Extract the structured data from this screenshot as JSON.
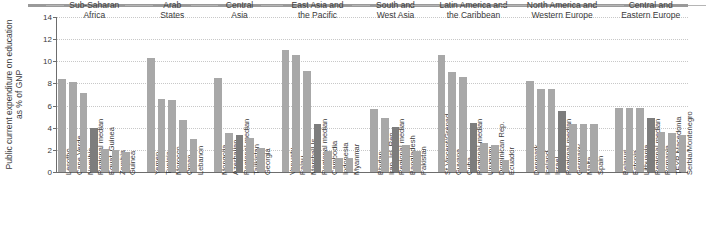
{
  "figure": {
    "ylabel": "Public current expenditure on education as % of GNP",
    "footnote": ""
  },
  "chart_data": {
    "type": "bar",
    "title": "",
    "xlabel": "",
    "ylabel": "Public current expenditure on education as % of GNP",
    "ylim": [
      0,
      14
    ],
    "yticks": [
      0,
      2,
      4,
      6,
      8,
      10,
      12,
      14
    ],
    "ytick_labels": [
      "0",
      "2",
      "4",
      "6",
      "8",
      "10",
      "12",
      "14"
    ],
    "grid": true,
    "legend": null,
    "median_color": "#7d7d7d",
    "bar_color": "#a8a8a8",
    "groups": [
      {
        "name": "Sub-Saharan Africa",
        "name_lines": [
          "Sub-Saharan",
          "Africa"
        ],
        "categories": [
          "Lesotho",
          "Cape Verde",
          "Namibia",
          "Regional median",
          "Equat. Guinea",
          "Zambia",
          "Guinea"
        ],
        "values": [
          8.4,
          8.1,
          7.1,
          4.0,
          2.1,
          2.0,
          1.8
        ],
        "median_index": 3
      },
      {
        "name": "Arab States",
        "name_lines": [
          "Arab",
          "States"
        ],
        "categories": [
          "Yemen",
          "Tunisia",
          "Morocco",
          "Oman",
          "Lebanon"
        ],
        "values": [
          10.3,
          6.6,
          6.5,
          4.7,
          3.0
        ],
        "median_index": -1
      },
      {
        "name": "Central Asia",
        "name_lines": [
          "Central",
          "Asia"
        ],
        "categories": [
          "Mongolia",
          "Azerbaijan",
          "Regional median",
          "Tajikistan",
          "Georgia"
        ],
        "values": [
          8.5,
          3.5,
          3.3,
          3.1,
          2.2
        ],
        "median_index": 2
      },
      {
        "name": "East Asia and the Pacific",
        "name_lines": [
          "East Asia and",
          "the Pacific"
        ],
        "categories": [
          "Vanuatu",
          "Palau",
          "Marshall Is",
          "Regional median",
          "Cambodia",
          "Indonesia",
          "Myanmar"
        ],
        "values": [
          11.0,
          10.6,
          9.1,
          4.3,
          1.9,
          1.3,
          1.3
        ],
        "median_index": 3
      },
      {
        "name": "South and West Asia",
        "name_lines": [
          "South and",
          "West Asia"
        ],
        "categories": [
          "Bhutan",
          "Iran, Isl. Rep.",
          "Regional median",
          "Bangladesh",
          "Pakistan"
        ],
        "values": [
          5.7,
          4.9,
          4.1,
          2.4,
          1.9
        ],
        "median_index": 2
      },
      {
        "name": "Latin America and the Caribbean",
        "name_lines": [
          "Latin America and",
          "the Caribbean"
        ],
        "categories": [
          "St Vincent/Grenad.",
          "Guyana",
          "Cuba",
          "Regional median",
          "Uruguay",
          "Dominican Rep.",
          "Ecuador"
        ],
        "values": [
          10.6,
          9.0,
          8.6,
          4.4,
          2.6,
          2.4,
          1.1
        ],
        "median_index": 3
      },
      {
        "name": "North America and Western Europe",
        "name_lines": [
          "North America and",
          "Western Europe"
        ],
        "categories": [
          "Denmark",
          "Iceland",
          "Israel",
          "Regional median",
          "Germany",
          "Malta",
          "Spain"
        ],
        "values": [
          8.2,
          7.5,
          7.5,
          5.5,
          4.3,
          4.3,
          4.3
        ],
        "median_index": 3
      },
      {
        "name": "Central and Eastern Europe",
        "name_lines": [
          "Central and",
          "Eastern Europe"
        ],
        "categories": [
          "Belarus",
          "Estonia",
          "Lithuania",
          "Regional median",
          "Romania",
          "TFYR Macedonia",
          "Serbia/Montenegro"
        ],
        "values": [
          5.8,
          5.8,
          5.8,
          4.9,
          3.6,
          3.5,
          3.3
        ],
        "median_index": 3
      }
    ]
  }
}
